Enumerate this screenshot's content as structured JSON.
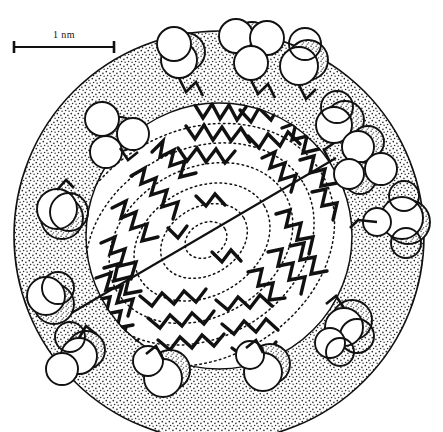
{
  "figure": {
    "background_color": "#ffffff",
    "ink_color": "#111111",
    "stipple_color": "#2a2a2a"
  },
  "scale_bar": {
    "label": "1 nm",
    "x_start": 13,
    "x_end": 115,
    "y": 47,
    "cap_height": 11
  },
  "particle": {
    "center_x": 219,
    "center_y": 236,
    "outer_radius": 205,
    "core_radius": 133,
    "shell_label": "stippled hydrophilic shell",
    "core_label": "hydrocarbon tail core"
  },
  "section_line": {
    "x1": 63,
    "y1": 318,
    "x2": 336,
    "y2": 158
  },
  "contours": {
    "count": 6,
    "style": "dotted",
    "center_x": 206,
    "center_y": 240
  },
  "head_groups": [
    {
      "id": "hg-top-1",
      "cx": 179,
      "cy": 60,
      "r": 18
    },
    {
      "id": "hg-top-2",
      "cx": 236,
      "cy": 36,
      "r": 17
    },
    {
      "id": "hg-top-3",
      "cx": 267,
      "cy": 38,
      "r": 17
    },
    {
      "id": "hg-top-4",
      "cx": 249,
      "cy": 62,
      "r": 17
    },
    {
      "id": "hg-top-5",
      "cx": 299,
      "cy": 66,
      "r": 19
    },
    {
      "id": "hg-ul-1",
      "cx": 102,
      "cy": 119,
      "r": 17
    },
    {
      "id": "hg-ul-2",
      "cx": 133,
      "cy": 134,
      "r": 16
    },
    {
      "id": "hg-ul-3",
      "cx": 107,
      "cy": 151,
      "r": 16
    },
    {
      "id": "hg-ur-1",
      "cx": 335,
      "cy": 124,
      "r": 18
    },
    {
      "id": "hg-ur-2",
      "cx": 360,
      "cy": 145,
      "r": 16
    },
    {
      "id": "hg-ur-3",
      "cx": 351,
      "cy": 173,
      "r": 15
    },
    {
      "id": "hg-ur-4",
      "cx": 380,
      "cy": 168,
      "r": 16
    },
    {
      "id": "hg-left-1",
      "cx": 57,
      "cy": 210,
      "r": 20
    },
    {
      "id": "hg-right-1",
      "cx": 403,
      "cy": 218,
      "r": 21
    },
    {
      "id": "hg-right-2",
      "cx": 377,
      "cy": 222,
      "r": 14
    },
    {
      "id": "hg-left-2",
      "cx": 48,
      "cy": 297,
      "r": 19
    },
    {
      "id": "hg-bl-1",
      "cx": 79,
      "cy": 355,
      "r": 18
    },
    {
      "id": "hg-bl-2",
      "cx": 63,
      "cy": 368,
      "r": 16
    },
    {
      "id": "hg-bot-1",
      "cx": 163,
      "cy": 377,
      "r": 19
    },
    {
      "id": "hg-bot-2",
      "cx": 150,
      "cy": 362,
      "r": 15
    },
    {
      "id": "hg-bot-3",
      "cx": 263,
      "cy": 371,
      "r": 19
    },
    {
      "id": "hg-bot-4",
      "cx": 252,
      "cy": 356,
      "r": 14
    },
    {
      "id": "hg-br-1",
      "cx": 345,
      "cy": 327,
      "r": 19
    },
    {
      "id": "hg-br-2",
      "cx": 330,
      "cy": 342,
      "r": 15
    }
  ]
}
